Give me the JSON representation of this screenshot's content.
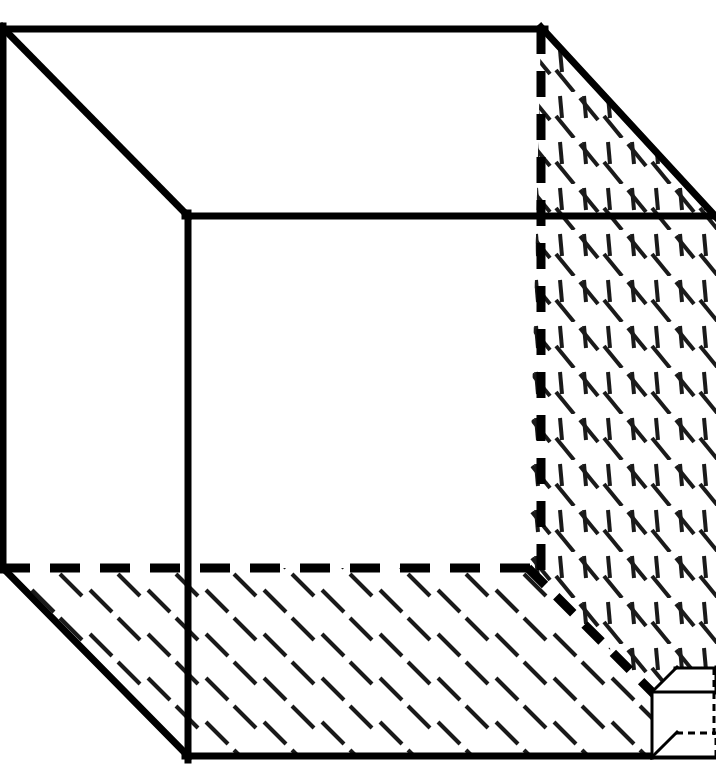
{
  "figure": {
    "kind": "line-drawing",
    "title": "",
    "caption": "",
    "labels": [],
    "annotations": [],
    "background_color": "#ffffff",
    "ink_color": "#000000",
    "hatch_color": "#1a1a1a",
    "canvas": {
      "width": 716,
      "height": 784
    }
  },
  "geometry": {
    "projection": "oblique-cabinet",
    "depth_offset": {
      "dx": -185,
      "dy": -188
    },
    "front_face": {
      "name": "front-opening-square",
      "points": [
        [
          188,
          216
        ],
        [
          716,
          216
        ],
        [
          716,
          757
        ],
        [
          188,
          757
        ]
      ],
      "stroke_width": 7,
      "style": "solid"
    },
    "back_face": {
      "name": "back-face-square",
      "points": [
        [
          3,
          28
        ],
        [
          542,
          28
        ],
        [
          542,
          568
        ],
        [
          3,
          568
        ]
      ],
      "stroke_width": 7,
      "style": "mixed"
    },
    "solid_edges": [
      {
        "name": "back-top-edge",
        "from": [
          3,
          28
        ],
        "to": [
          542,
          28
        ]
      },
      {
        "name": "back-left-edge",
        "from": [
          3,
          28
        ],
        "to": [
          3,
          568
        ]
      },
      {
        "name": "top-left-receding-edge",
        "from": [
          3,
          28
        ],
        "to": [
          188,
          216
        ]
      },
      {
        "name": "top-right-receding-edge",
        "from": [
          542,
          28
        ],
        "to": [
          716,
          216
        ]
      },
      {
        "name": "bottom-left-receding-edge",
        "from": [
          3,
          568
        ],
        "to": [
          188,
          757
        ]
      },
      {
        "name": "front-top-edge",
        "from": [
          188,
          216
        ],
        "to": [
          716,
          216
        ]
      },
      {
        "name": "front-left-edge",
        "from": [
          188,
          216
        ],
        "to": [
          188,
          757
        ]
      },
      {
        "name": "front-bottom-edge",
        "from": [
          188,
          757
        ],
        "to": [
          716,
          757
        ]
      }
    ],
    "hidden_edges": [
      {
        "name": "hidden-vertical-right-back-edge",
        "from": [
          541,
          28
        ],
        "to": [
          541,
          568
        ],
        "dash": "26 17",
        "stroke_width": 9
      },
      {
        "name": "hidden-horizontal-back-floor-edge",
        "from": [
          3,
          568
        ],
        "to": [
          530,
          568
        ],
        "dash": "30 20",
        "stroke_width": 9
      },
      {
        "name": "hidden-diagonal-floor-wall-edge",
        "from": [
          528,
          568
        ],
        "to": [
          652,
          692
        ],
        "dash": "24 16",
        "stroke_width": 9
      }
    ],
    "hatched_faces": [
      {
        "name": "right-wall-face",
        "polygon": [
          [
            542,
            28
          ],
          [
            716,
            216
          ],
          [
            716,
            757
          ],
          [
            652,
            692
          ],
          [
            528,
            568
          ],
          [
            541,
            28
          ]
        ],
        "hatch_families": [
          "vertical-dashes",
          "diagonal-down-right-dashes"
        ]
      },
      {
        "name": "floor-face",
        "polygon": [
          [
            3,
            568
          ],
          [
            528,
            568
          ],
          [
            652,
            692
          ],
          [
            716,
            757
          ],
          [
            188,
            757
          ]
        ],
        "hatch_families": [
          "diagonal-down-right-dashes"
        ]
      }
    ],
    "small_cube": {
      "name": "unit-cube",
      "front_face": [
        [
          652,
          692
        ],
        [
          716,
          692
        ],
        [
          716,
          757
        ],
        [
          652,
          757
        ]
      ],
      "back_face": [
        [
          676,
          668
        ],
        [
          716,
          668
        ],
        [
          716,
          733
        ],
        [
          676,
          733
        ]
      ],
      "stroke_width": 3,
      "solid_edges": [
        {
          "name": "unit-cube-front-top",
          "from": [
            652,
            692
          ],
          "to": [
            716,
            692
          ]
        },
        {
          "name": "unit-cube-front-left",
          "from": [
            652,
            692
          ],
          "to": [
            652,
            757
          ]
        },
        {
          "name": "unit-cube-front-bottom",
          "from": [
            652,
            757
          ],
          "to": [
            716,
            757
          ]
        },
        {
          "name": "unit-cube-back-top",
          "from": [
            676,
            668
          ],
          "to": [
            716,
            668
          ]
        },
        {
          "name": "unit-cube-top-left-receding",
          "from": [
            652,
            692
          ],
          "to": [
            676,
            668
          ]
        },
        {
          "name": "unit-cube-top-right-receding",
          "from": [
            716,
            692
          ],
          "to": [
            716,
            668
          ]
        },
        {
          "name": "unit-cube-bottom-left-receding",
          "from": [
            652,
            757
          ],
          "to": [
            676,
            733
          ]
        }
      ],
      "hidden_edges": [
        {
          "name": "unit-cube-hidden-vertical",
          "from": [
            714,
            668
          ],
          "to": [
            714,
            733
          ],
          "dash": "7 5"
        },
        {
          "name": "unit-cube-hidden-horizontal",
          "from": [
            676,
            733
          ],
          "to": [
            716,
            733
          ],
          "dash": "7 5"
        }
      ]
    }
  },
  "hatch_spec": {
    "right_wall": {
      "vertical": {
        "spacing_x": 24,
        "spacing_y": 46,
        "length": 22,
        "angle_deg": 84,
        "stroke_width": 4
      },
      "diagonal": {
        "spacing_x": 48,
        "spacing_y": 46,
        "length": 26,
        "angle_deg": 52,
        "stroke_width": 4
      }
    },
    "floor": {
      "diagonal": {
        "spacing_x": 58,
        "spacing_y": 44,
        "length": 30,
        "angle_deg": 46,
        "stroke_width": 4
      }
    }
  }
}
